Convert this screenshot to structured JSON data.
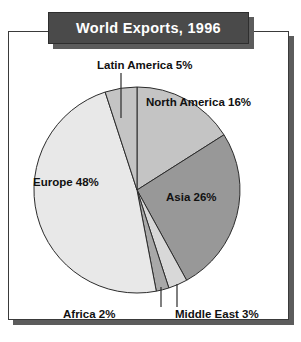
{
  "figure": {
    "title": "World Exports, 1996",
    "title_bg": "#4a4a4a",
    "title_fg": "#ffffff",
    "frame_color": "#3a3a3a",
    "shadow_color": "#5c5c5c",
    "background": "#ffffff"
  },
  "labels": {
    "latin_america": "Latin America 5%",
    "north_america": "North America 16%",
    "asia": "Asia 26%",
    "europe": "Europe 48%",
    "africa": "Africa 2%",
    "middle_east": "Middle East 3%"
  },
  "chart_data": {
    "type": "pie",
    "title": "World Exports, 1996",
    "xlabel": "",
    "ylabel": "",
    "units": "percent",
    "total": 100,
    "start_angle_deg": 0,
    "direction": "clockwise",
    "legend": "none",
    "grid": false,
    "data_labels": true,
    "categories": [
      "North America",
      "Asia",
      "Middle East",
      "Africa",
      "Europe",
      "Latin America"
    ],
    "values": [
      16,
      26,
      3,
      2,
      48,
      5
    ],
    "slices": [
      {
        "name": "North America",
        "value": 16,
        "label": "North America 16%",
        "color": "#c4c4c4",
        "label_position": "inside"
      },
      {
        "name": "Asia",
        "value": 26,
        "label": "Asia 26%",
        "color": "#989898",
        "label_position": "inside"
      },
      {
        "name": "Middle East",
        "value": 3,
        "label": "Middle East 3%",
        "color": "#d8d8d8",
        "label_position": "outside-leader"
      },
      {
        "name": "Africa",
        "value": 2,
        "label": "Africa 2%",
        "color": "#a8a8a8",
        "label_position": "outside-leader"
      },
      {
        "name": "Europe",
        "value": 48,
        "label": "Europe 48%",
        "color": "#e8e8e8",
        "label_position": "inside"
      },
      {
        "name": "Latin America",
        "value": 5,
        "label": "Latin America 5%",
        "color": "#c4c4c4",
        "label_position": "outside-leader"
      }
    ]
  }
}
